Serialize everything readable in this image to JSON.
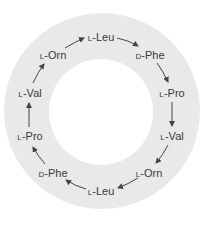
{
  "diagram": {
    "type": "cyclic peptide ring",
    "direction": "clockwise",
    "residues": [
      {
        "prefix": "L",
        "name": "-Leu",
        "x": 101,
        "y": 37
      },
      {
        "prefix": "D",
        "name": "-Phe",
        "x": 150,
        "y": 55
      },
      {
        "prefix": "L",
        "name": "-Pro",
        "x": 172,
        "y": 93
      },
      {
        "prefix": "L",
        "name": "-Val",
        "x": 172,
        "y": 136
      },
      {
        "prefix": "L",
        "name": "-Orn",
        "x": 149,
        "y": 173
      },
      {
        "prefix": "L",
        "name": "-Leu",
        "x": 101,
        "y": 191
      },
      {
        "prefix": "D",
        "name": "-Phe",
        "x": 53,
        "y": 173
      },
      {
        "prefix": "L",
        "name": "-Pro",
        "x": 30,
        "y": 136
      },
      {
        "prefix": "L",
        "name": "-Val",
        "x": 30,
        "y": 93
      },
      {
        "prefix": "L",
        "name": "-Orn",
        "x": 53,
        "y": 55
      }
    ],
    "colors": {
      "ring": "#e9e9e9",
      "text": "#3a3a3a",
      "arrow": "#444444"
    }
  }
}
